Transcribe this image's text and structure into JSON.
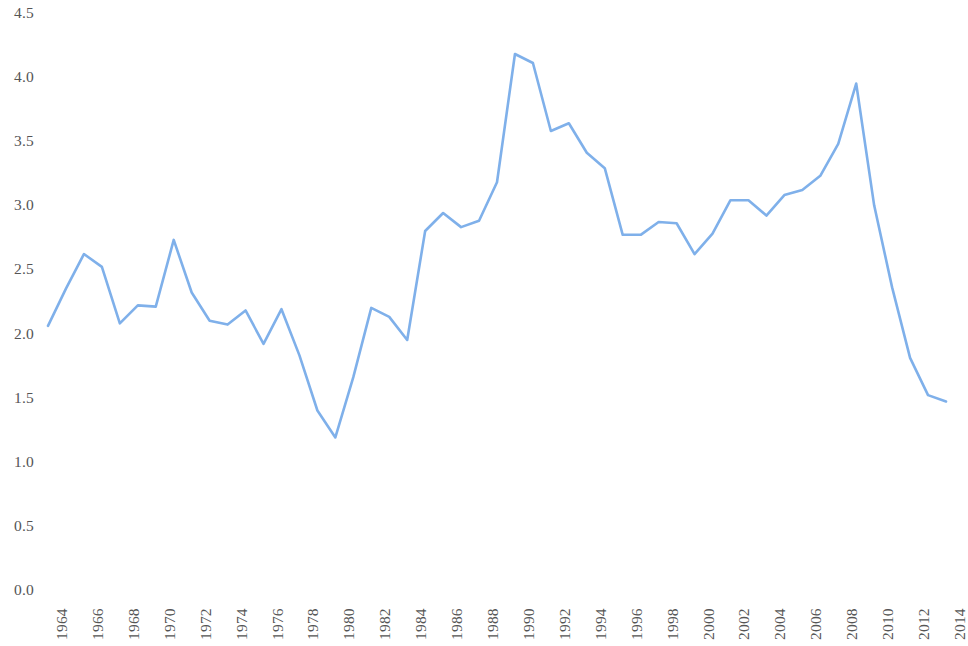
{
  "chart_data": {
    "type": "line",
    "title": "",
    "subtitle": "",
    "xlabel": "",
    "ylabel": "",
    "legend": [],
    "legend_position": "none",
    "grid": false,
    "background_color": "#ffffff",
    "line_color": "#7FB0EA",
    "line_width": 2.6,
    "ylim": [
      0.0,
      4.5
    ],
    "xlim": [
      1964,
      2014
    ],
    "y_ticks": [
      "0.0",
      "0.5",
      "1.0",
      "1.5",
      "2.0",
      "2.5",
      "3.0",
      "3.5",
      "4.0",
      "4.5"
    ],
    "y_tick_values": [
      0.0,
      0.5,
      1.0,
      1.5,
      2.0,
      2.5,
      3.0,
      3.5,
      4.0,
      4.5
    ],
    "x_ticks": [
      "1964",
      "1966",
      "1968",
      "1970",
      "1972",
      "1974",
      "1976",
      "1978",
      "1980",
      "1982",
      "1984",
      "1986",
      "1988",
      "1990",
      "1992",
      "1994",
      "1996",
      "1998",
      "2000",
      "2002",
      "2004",
      "2006",
      "2008",
      "2010",
      "2012",
      "2014"
    ],
    "x_tick_values": [
      1964,
      1966,
      1968,
      1970,
      1972,
      1974,
      1976,
      1978,
      1980,
      1982,
      1984,
      1986,
      1988,
      1990,
      1992,
      1994,
      1996,
      1998,
      2000,
      2002,
      2004,
      2006,
      2008,
      2010,
      2012,
      2014
    ],
    "x_tick_rotation": -90,
    "x": [
      1964,
      1965,
      1966,
      1967,
      1968,
      1969,
      1970,
      1971,
      1972,
      1973,
      1974,
      1975,
      1976,
      1977,
      1978,
      1979,
      1980,
      1981,
      1982,
      1983,
      1984,
      1985,
      1986,
      1987,
      1988,
      1989,
      1990,
      1991,
      1992,
      1993,
      1994,
      1995,
      1996,
      1997,
      1998,
      1999,
      2000,
      2001,
      2002,
      2003,
      2004,
      2005,
      2006,
      2007,
      2008,
      2009,
      2010,
      2011,
      2012,
      2013,
      2014
    ],
    "values": [
      2.06,
      2.35,
      2.62,
      2.52,
      2.08,
      2.22,
      2.21,
      2.73,
      2.32,
      2.1,
      2.07,
      2.18,
      1.92,
      2.19,
      1.83,
      1.4,
      1.19,
      1.66,
      2.2,
      2.13,
      1.95,
      2.8,
      2.94,
      2.83,
      2.88,
      3.18,
      4.18,
      4.11,
      3.58,
      3.64,
      3.41,
      3.29,
      2.77,
      2.77,
      2.87,
      2.86,
      2.62,
      2.78,
      3.04,
      3.04,
      2.92,
      3.08,
      3.12,
      3.23,
      3.48,
      3.95,
      3.0,
      2.36,
      1.81,
      1.52,
      1.47
    ],
    "series": [
      {
        "name": "series-1",
        "color": "#7FB0EA",
        "values": [
          2.06,
          2.35,
          2.62,
          2.52,
          2.08,
          2.22,
          2.21,
          2.73,
          2.32,
          2.1,
          2.07,
          2.18,
          1.92,
          2.19,
          1.83,
          1.4,
          1.19,
          1.66,
          2.2,
          2.13,
          1.95,
          2.8,
          2.94,
          2.83,
          2.88,
          3.18,
          4.18,
          4.11,
          3.58,
          3.64,
          3.41,
          3.29,
          2.77,
          2.77,
          2.87,
          2.86,
          2.62,
          2.78,
          3.04,
          3.04,
          2.92,
          3.08,
          3.12,
          3.23,
          3.48,
          3.95,
          3.0,
          2.36,
          1.81,
          1.52,
          1.47
        ]
      }
    ],
    "annotations": []
  }
}
